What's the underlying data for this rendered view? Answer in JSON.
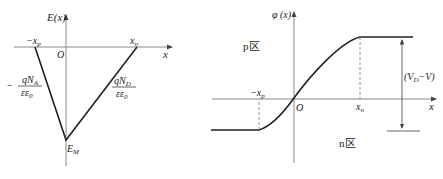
{
  "left_diagram": {
    "title": "Electric field distribution E(x)",
    "y_label": "E(x)",
    "x_label": "x",
    "origin": "O",
    "neg_xp": "−x",
    "neg_xp_sub": "p",
    "xn": "x",
    "xn_sub": "n",
    "peak": "E",
    "peak_sub": "M",
    "left_slope": {
      "sign": "−",
      "numerator": "qN",
      "numerator_sub": "A",
      "denominator": "εε",
      "denominator_sub": "0"
    },
    "right_slope": {
      "numerator": "qN",
      "numerator_sub": "D",
      "denominator": "εε",
      "denominator_sub": "0"
    }
  },
  "right_diagram": {
    "title": "Potential distribution φ(x)",
    "y_label": "φ (x)",
    "x_label": "x",
    "origin": "O",
    "neg_xp": "−x",
    "neg_xp_sub": "p",
    "xn": "x",
    "xn_sub": "n",
    "p_region": "p区",
    "n_region": "n区",
    "barrier": {
      "open": "(V",
      "sub": "D",
      "close": "−V)"
    }
  }
}
